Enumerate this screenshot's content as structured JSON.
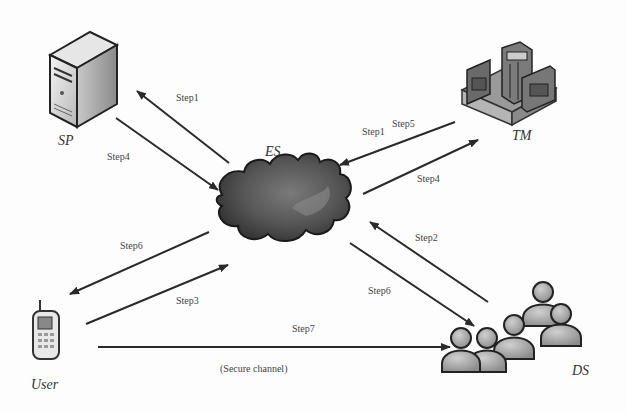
{
  "diagram": {
    "nodes": {
      "sp": {
        "label": "SP",
        "icon": "server-icon"
      },
      "tm": {
        "label": "TM",
        "icon": "building-icon"
      },
      "es": {
        "label": "ES",
        "icon": "cloud-icon"
      },
      "user": {
        "label": "User",
        "icon": "mobile-phone-icon"
      },
      "ds": {
        "label": "DS",
        "icon": "people-group-icon"
      }
    },
    "edges": [
      {
        "from": "ES",
        "to": "SP",
        "label": "Step1"
      },
      {
        "from": "SP",
        "to": "ES",
        "label": "Step4"
      },
      {
        "from": "TM",
        "to": "ES",
        "label": "Step5"
      },
      {
        "from": "TM",
        "to": "ES",
        "label": "Step1"
      },
      {
        "from": "ES",
        "to": "TM",
        "label": "Step4"
      },
      {
        "from": "DS",
        "to": "ES",
        "label": "Step2"
      },
      {
        "from": "ES",
        "to": "DS",
        "label": "Step6"
      },
      {
        "from": "ES",
        "to": "User",
        "label": "Step6"
      },
      {
        "from": "User",
        "to": "ES",
        "label": "Step3"
      },
      {
        "from": "User",
        "to": "DS",
        "label": "Step7",
        "sublabel": "(Secure channel)"
      }
    ]
  }
}
